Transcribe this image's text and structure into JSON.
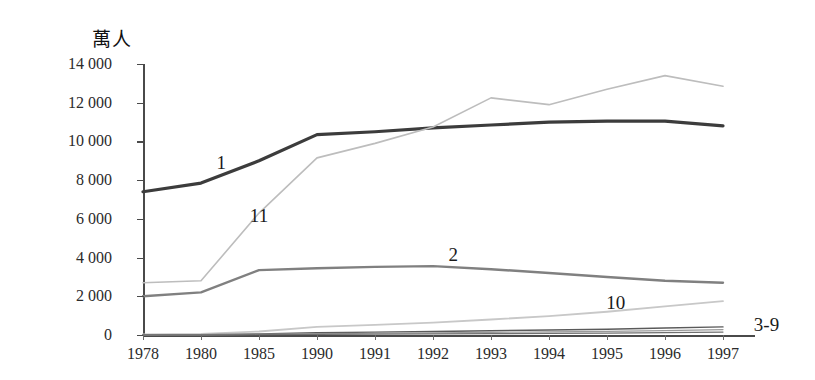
{
  "chart_data": {
    "type": "line",
    "title": "",
    "unit_label": "萬人",
    "xlabel": "",
    "ylabel": "萬人",
    "categories": [
      "1978",
      "1980",
      "1985",
      "1990",
      "1991",
      "1992",
      "1993",
      "1994",
      "1995",
      "1996",
      "1997"
    ],
    "ylim": [
      0,
      14000
    ],
    "ytick_values": [
      0,
      2000,
      4000,
      6000,
      8000,
      10000,
      12000,
      14000
    ],
    "ytick_labels": [
      "0",
      "2 000",
      "4 000",
      "6 000",
      "8 000",
      "10 000",
      "12 000",
      "14 000"
    ],
    "grid": false,
    "legend_position": "inline-annotations",
    "series": [
      {
        "name": "1",
        "label": "1",
        "color": "#3c3c3c",
        "width": 3.2,
        "values": [
          7400,
          7850,
          9000,
          10350,
          10500,
          10700,
          10850,
          11000,
          11050,
          11050,
          10800
        ]
      },
      {
        "name": "11",
        "label": "11",
        "color": "#bdbdbd",
        "width": 1.6,
        "values": [
          2700,
          2800,
          6300,
          9150,
          9900,
          10750,
          12250,
          11900,
          12700,
          13400,
          12850
        ]
      },
      {
        "name": "2",
        "label": "2",
        "color": "#808080",
        "width": 2.4,
        "values": [
          2000,
          2200,
          3350,
          3450,
          3520,
          3560,
          3400,
          3200,
          3000,
          2800,
          2700
        ]
      },
      {
        "name": "10",
        "label": "10",
        "color": "#c8c8c8",
        "width": 1.8,
        "values": [
          30,
          60,
          180,
          420,
          520,
          640,
          800,
          980,
          1200,
          1480,
          1750
        ]
      },
      {
        "name": "3-9",
        "label": "3-9",
        "color": "#5a5a5a",
        "width": 1.4,
        "values": [
          10,
          20,
          60,
          120,
          150,
          180,
          220,
          260,
          300,
          360,
          420
        ]
      },
      {
        "name": "3-9b",
        "label": "",
        "color": "#9a9a9a",
        "width": 1.2,
        "values": [
          5,
          10,
          35,
          70,
          90,
          110,
          135,
          160,
          190,
          230,
          280
        ]
      },
      {
        "name": "3-9c",
        "label": "",
        "color": "#707070",
        "width": 1.2,
        "values": [
          2,
          5,
          15,
          35,
          45,
          55,
          70,
          85,
          100,
          125,
          150
        ]
      }
    ],
    "annotations": [
      {
        "text": "1",
        "category_index": 1.35,
        "value": 8900
      },
      {
        "text": "11",
        "category_index": 2.0,
        "value": 6150
      },
      {
        "text": "2",
        "category_index": 5.35,
        "value": 4150
      },
      {
        "text": "10",
        "category_index": 8.15,
        "value": 1650
      },
      {
        "text": "3-9",
        "category_index": 10.75,
        "value": 520
      }
    ]
  }
}
